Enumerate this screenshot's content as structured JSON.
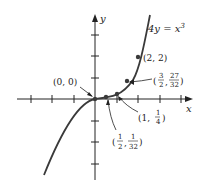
{
  "figure": {
    "equation": "4y = x",
    "equation_exp": "3",
    "x_axis_label": "x",
    "y_axis_label": "y",
    "origin_px": [
      95,
      99
    ],
    "unit_px": 21.5,
    "x_ticks": [
      -3,
      -2,
      -1,
      1,
      2,
      3,
      4
    ],
    "y_ticks": [
      -3,
      -2,
      -1,
      1,
      2,
      3
    ],
    "points": [
      {
        "x": 0,
        "y": 0,
        "label": "(0, 0)"
      },
      {
        "x": 0.5,
        "y": 0.03125,
        "label": "(1/2, 1/32)"
      },
      {
        "x": 1,
        "y": 0.25,
        "label": "(1, 1/4)"
      },
      {
        "x": 1.5,
        "y": 0.84375,
        "label": "(3/2, 27/32)"
      },
      {
        "x": 2,
        "y": 2,
        "label": "(2, 2)"
      }
    ],
    "labels": {
      "p0": "(0, 0)",
      "p4": "(2, 2)",
      "p2_open": "(1, ",
      "p2_num": "1",
      "p2_den": "4",
      "p2_close": ")",
      "p1_num1": "1",
      "p1_den1": "2",
      "p1_num2": "1",
      "p1_den2": "32",
      "p3_num1": "3",
      "p3_den1": "2",
      "p3_num2": "27",
      "p3_den2": "32"
    },
    "colors": {
      "curve": "#3a3a3a",
      "axis": "#222222",
      "text": "#222222"
    }
  }
}
